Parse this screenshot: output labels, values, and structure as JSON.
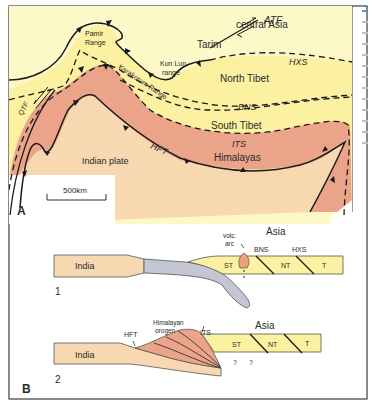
{
  "colors": {
    "asia_yellow": "#fdf6b8",
    "tibet_yellow": "#fbf1a2",
    "himalaya_salmon": "#eba48a",
    "india_tan": "#f8d8b0",
    "slab_gray": "#c4c6d4",
    "arc_orange": "#ee9e78",
    "line": "#1a1a1a",
    "frame": "#3a3a3a"
  },
  "panelA": {
    "label": "A",
    "regions": {
      "central_asia": "central Asia",
      "tarim": "Tarim",
      "pamir": [
        "Pamir",
        "Range"
      ],
      "kunlun": [
        "Kun Lun",
        "range"
      ],
      "karakorum": "Karakorum Range",
      "north_tibet": "North Tibet",
      "south_tibet": "South Tibet",
      "himalayas": "Himalayas",
      "indian_plate": "Indian plate"
    },
    "faults": {
      "atf": "ATF",
      "hxs": "HXS",
      "bns": "BNS",
      "its": "ITS",
      "hft": "HFT",
      "qtf": "QTF"
    },
    "scale_bar": "500km"
  },
  "panelB": {
    "label": "B",
    "section1": {
      "number": "1",
      "india": "India",
      "asia": "Asia",
      "volc_arc": [
        "volc.",
        "arc"
      ],
      "bns": "BNS",
      "hxs": "HXS",
      "blocks": [
        "ST",
        "NT",
        "T"
      ]
    },
    "section2": {
      "number": "2",
      "india": "India",
      "asia": "Asia",
      "hft": "HFT",
      "orogen": [
        "Himalayan",
        "orogen"
      ],
      "its": "ITS",
      "blocks": [
        "ST",
        "NT",
        "T"
      ],
      "unknown": [
        "?",
        "?"
      ]
    }
  }
}
